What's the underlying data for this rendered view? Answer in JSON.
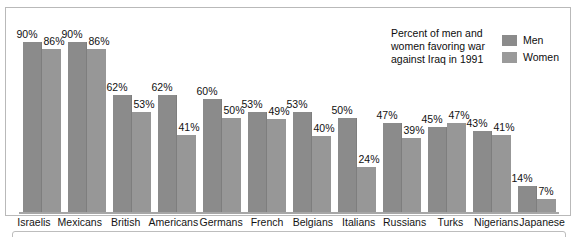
{
  "chart_data": {
    "type": "bar",
    "title": "",
    "caption": "Percent of men and women favoring war against Iraq in 1991",
    "xlabel": "",
    "ylabel": "",
    "ylim": [
      0,
      100
    ],
    "grid": false,
    "legend_position": "top-right",
    "value_suffix": "%",
    "categories": [
      "Israelis",
      "Mexicans",
      "British",
      "Americans",
      "Germans",
      "French",
      "Belgians",
      "Italians",
      "Russians",
      "Turks",
      "Nigerians",
      "Japanese"
    ],
    "series": [
      {
        "name": "Men",
        "color": "#8b8b8b",
        "values": [
          90,
          90,
          62,
          62,
          60,
          53,
          53,
          50,
          47,
          45,
          43,
          14
        ]
      },
      {
        "name": "Women",
        "color": "#979797",
        "values": [
          86,
          86,
          53,
          41,
          50,
          49,
          40,
          24,
          39,
          47,
          41,
          7
        ]
      }
    ],
    "labels": {
      "Israelis": {
        "men": "90%",
        "women": "86%"
      },
      "Mexicans": {
        "men": "90%",
        "women": "86%"
      },
      "British": {
        "men": "62%",
        "women": "53%"
      },
      "Americans": {
        "men": "62%",
        "women": "41%"
      },
      "Germans": {
        "men": "60%",
        "women": "50%"
      },
      "French": {
        "men": "53%",
        "women": "49%"
      },
      "Belgians": {
        "men": "53%",
        "women": "40%"
      },
      "Italians": {
        "men": "50%",
        "women": "24%"
      },
      "Russians": {
        "men": "47%",
        "women": "39%"
      },
      "Turks": {
        "men": "45%",
        "women": "47%"
      },
      "Nigerians": {
        "men": "43%",
        "women": "41%"
      },
      "Japanese": {
        "men": "14%",
        "women": "7%"
      }
    }
  },
  "legend": {
    "caption": "Percent of men and women favoring war against Iraq in 1991",
    "items": [
      {
        "label": "Men",
        "color": "#8b8b8b"
      },
      {
        "label": "Women",
        "color": "#9a9a9a"
      }
    ]
  }
}
